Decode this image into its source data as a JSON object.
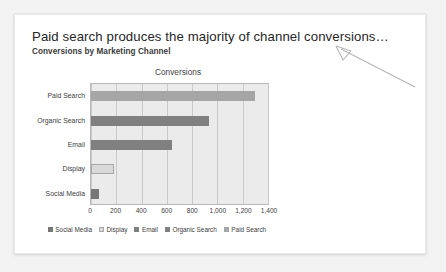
{
  "slide": {
    "title": "Paid search produces the majority of channel conversions…",
    "subtitle": "Conversions by Marketing Channel"
  },
  "annotation": {
    "arrow_name": "pointer-arrow",
    "color": "#b0b0b0"
  },
  "chart_data": {
    "type": "bar",
    "orientation": "horizontal",
    "title": "Conversions",
    "xlabel": "",
    "ylabel": "",
    "categories": [
      "Social Media",
      "Display",
      "Email",
      "Organic Search",
      "Paid Search"
    ],
    "values": [
      60,
      180,
      640,
      930,
      1300
    ],
    "display_order_top_to_bottom": [
      "Paid Search",
      "Organic Search",
      "Email",
      "Display",
      "Social Media"
    ],
    "xlim": [
      0,
      1400
    ],
    "xticks": [
      0,
      200,
      400,
      600,
      800,
      1000,
      1200,
      1400
    ],
    "xtick_labels": [
      "0",
      "200",
      "400",
      "600",
      "800",
      "1,000",
      "1,200",
      "1,400"
    ],
    "grid": true,
    "grid_axis": "x",
    "legend_position": "bottom",
    "series_colors": {
      "Social Media": "#777777",
      "Display": "#d9d9d9",
      "Email": "#808080",
      "Organic Search": "#808080",
      "Paid Search": "#a6a6a6"
    },
    "bar_styles": [
      "darkest",
      "light",
      "dark",
      "dark",
      "mid"
    ],
    "legend": [
      {
        "label": "Social Media",
        "style": "darkest"
      },
      {
        "label": "Display",
        "style": "light"
      },
      {
        "label": "Email",
        "style": "dark"
      },
      {
        "label": "Organic Search",
        "style": "dark"
      },
      {
        "label": "Paid Search",
        "style": "mid"
      }
    ],
    "plot_background": "#ebebeb"
  }
}
